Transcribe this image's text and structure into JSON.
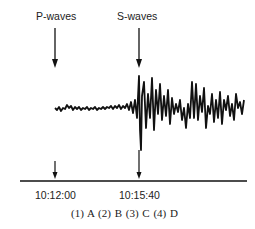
{
  "diagram": {
    "labels": {
      "p_waves": "P-waves",
      "s_waves": "S-waves"
    },
    "time_axis": {
      "p_arrival": "10:12:00",
      "s_arrival": "10:15:40"
    },
    "answer_options": "(1) A  (2) B  (3) C  (4) D",
    "options": [
      {
        "number": "(1)",
        "label": "A"
      },
      {
        "number": "(2)",
        "label": "B"
      },
      {
        "number": "(3)",
        "label": "C"
      },
      {
        "number": "(4)",
        "label": "D"
      }
    ]
  }
}
